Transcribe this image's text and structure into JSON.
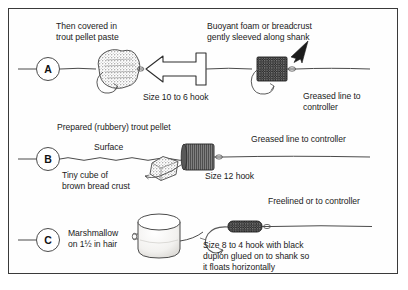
{
  "figure": {
    "type": "line-illustration",
    "border_color": "#3a3a3a",
    "background_color": "#ffffff",
    "ink_color": "#1b1b1b"
  },
  "panels": [
    {
      "letter": "A",
      "labels": {
        "bait_note": "Then covered in\ntrout pellet paste",
        "hook_size": "Size 10 to 6 hook",
        "foam_note": "Buoyant foam or breadcrust\ngently sleeved along shank",
        "line_note": "Greased line to\ncontroller"
      },
      "icons": [
        "paste-ball",
        "hook",
        "left-arrow",
        "foam-sleeve",
        "fishing-line"
      ]
    },
    {
      "letter": "B",
      "labels": {
        "pellet_note": "Prepared (rubbery) trout pellet",
        "surface": "Surface",
        "crust_note": "Tiny cube of\nbrown bread crust",
        "hook_size": "Size 12 hook",
        "line_note": "Greased line to controller"
      },
      "icons": [
        "bread-cube",
        "trout-pellet",
        "hook",
        "water-surface-line"
      ]
    },
    {
      "letter": "C",
      "labels": {
        "bait_note": "Marshmallow\non 1½ in hair",
        "line_note": "Freelined or to controller",
        "hook_note": "Size 8 to 4 hook with black\nduplon glued on to shank so\nit floats horizontally"
      },
      "icons": [
        "marshmallow",
        "hook",
        "duplon-sleeve",
        "fishing-line"
      ]
    }
  ],
  "labels_flat": {
    "a_bait_line1": "Then covered in",
    "a_bait_line2": "trout pellet paste",
    "a_hook_size": "Size 10 to 6 hook",
    "a_foam_line1": "Buoyant foam or breadcrust",
    "a_foam_line2": "gently sleeved along shank",
    "a_line_line1": "Greased line to",
    "a_line_line2": "controller",
    "b_pellet": "Prepared (rubbery) trout pellet",
    "b_surface": "Surface",
    "b_crust_line1": "Tiny cube of",
    "b_crust_line2": "brown bread crust",
    "b_hook_size": "Size 12 hook",
    "b_line": "Greased line to controller",
    "c_bait_line1": "Marshmallow",
    "c_bait_line2": "on 1½ in hair",
    "c_line": "Freelined or to controller",
    "c_hook_line1": "Size 8 to 4 hook with black",
    "c_hook_line2": "duplon glued on to shank so",
    "c_hook_line3": "it floats horizontally",
    "letter_a": "A",
    "letter_b": "B",
    "letter_c": "C"
  }
}
